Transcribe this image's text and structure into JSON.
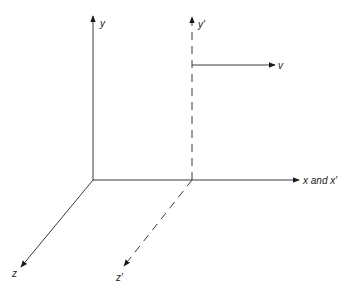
{
  "diagram": {
    "type": "coordinate-frames",
    "colors": {
      "line": "#3a3a3a",
      "text": "#1a1a1a",
      "background": "#ffffff"
    },
    "frame_S": {
      "origin": [
        93,
        180
      ],
      "axes": {
        "y": {
          "label": "y",
          "style": "solid"
        },
        "x": {
          "label": "x and x′",
          "style": "solid"
        },
        "z": {
          "label": "z",
          "style": "solid"
        }
      }
    },
    "frame_S_prime": {
      "origin": [
        192,
        180
      ],
      "axes": {
        "y_prime": {
          "label": "y′",
          "style": "dashed"
        },
        "z_prime": {
          "label": "z′",
          "style": "dashed"
        }
      }
    },
    "velocity": {
      "label": "v",
      "direction": "+x"
    }
  }
}
